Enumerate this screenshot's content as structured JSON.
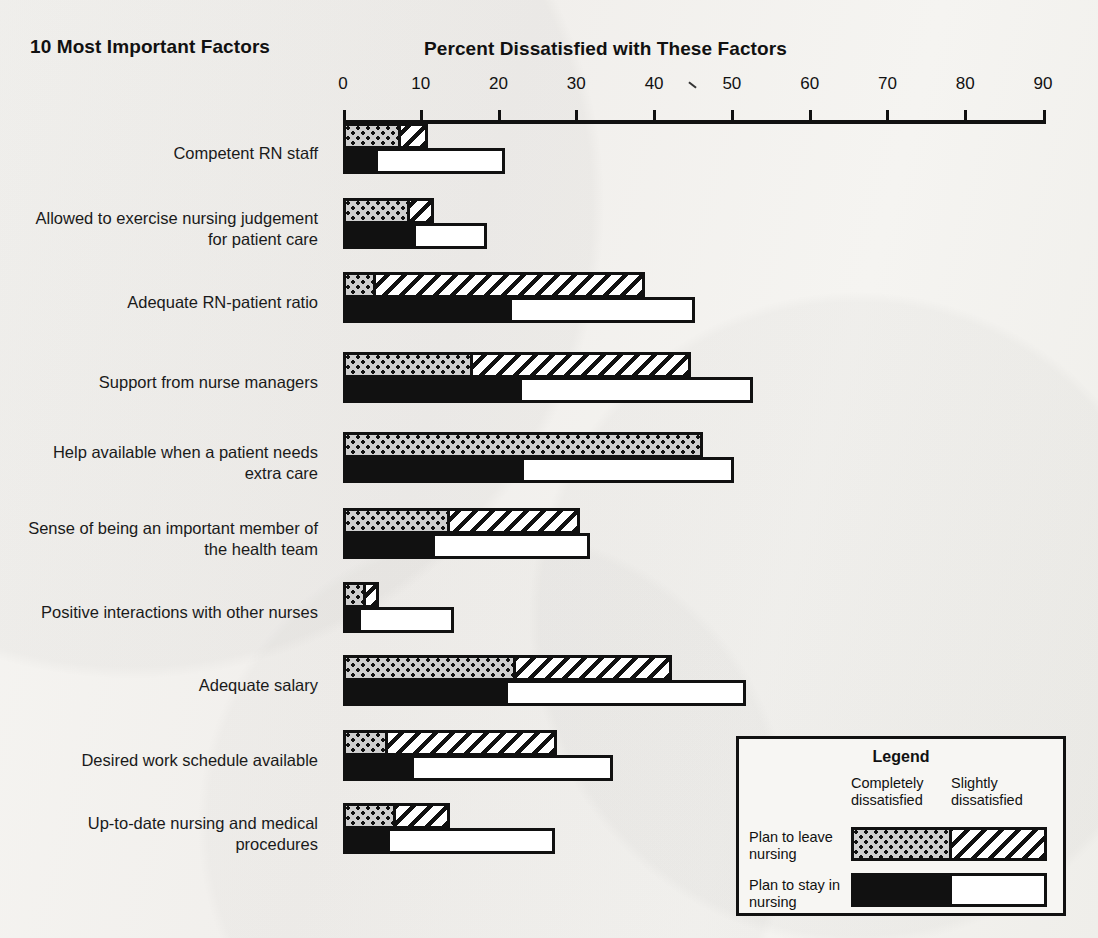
{
  "headings": {
    "left": "10 Most Important Factors",
    "right": "Percent Dissatisfied with These Factors"
  },
  "legend": {
    "title": "Legend",
    "col_completely": "Completely dissatisfied",
    "col_slightly": "Slightly dissatisfied",
    "row_leave": "Plan to leave nursing",
    "row_stay": "Plan to stay in nursing"
  },
  "chart_data": {
    "type": "bar",
    "orientation": "horizontal",
    "title": "Percent Dissatisfied with These Factors",
    "subtitle": "10 Most Important Factors",
    "xlabel": "Percent Dissatisfied with These Factors",
    "ylabel": "10 Most Important Factors",
    "xlim": [
      0,
      90
    ],
    "xticks": [
      0,
      10,
      20,
      30,
      40,
      50,
      60,
      70,
      80,
      90
    ],
    "xticklabels": [
      "0",
      "10",
      "20",
      "30",
      "40",
      "50",
      "60",
      "70",
      "80",
      "90"
    ],
    "grid": false,
    "legend_position": "bottom-right",
    "stacked": true,
    "group_series": [
      {
        "name": "Plan to leave nursing",
        "segments": [
          "Completely dissatisfied",
          "Slightly dissatisfied"
        ],
        "fills": [
          "dotted",
          "hatched"
        ]
      },
      {
        "name": "Plan to stay in nursing",
        "segments": [
          "Completely dissatisfied",
          "Slightly dissatisfied"
        ],
        "fills": [
          "solid-black",
          "white"
        ]
      }
    ],
    "categories": [
      "Competent RN staff",
      "Allowed to exercise nursing judgement for patient care",
      "Adequate RN-patient ratio",
      "Support from nurse managers",
      "Help available when a patient needs extra care",
      "Sense of being an important member of the health team",
      "Positive interactions with other nurses",
      "Adequate salary",
      "Desired work schedule available",
      "Up-to-date nursing and medical procedures"
    ],
    "category_lines": [
      [
        "Competent RN staff"
      ],
      [
        "Allowed to exercise nursing judgement",
        "for patient care"
      ],
      [
        "Adequate RN-patient ratio"
      ],
      [
        "Support from nurse managers"
      ],
      [
        "Help available when a patient needs",
        "extra care"
      ],
      [
        "Sense of being an important member of",
        "the health team"
      ],
      [
        "Positive interactions with other nurses"
      ],
      [
        "Adequate salary"
      ],
      [
        "Desired work schedule available"
      ],
      [
        "Up-to-date nursing and medical",
        "procedures"
      ]
    ],
    "rows": [
      {
        "category": "Competent RN staff",
        "leave": {
          "completely": 6.7,
          "slightly": 3.4,
          "total": 10.1
        },
        "stay": {
          "completely": 3.7,
          "slightly": 16.3,
          "total": 20.0
        }
      },
      {
        "category": "Allowed to exercise nursing judgement for patient care",
        "leave": {
          "completely": 7.8,
          "slightly": 3.1,
          "total": 10.9
        },
        "stay": {
          "completely": 8.6,
          "slightly": 9.2,
          "total": 17.8
        }
      },
      {
        "category": "Adequate RN-patient ratio",
        "leave": {
          "completely": 3.5,
          "slightly": 34.5,
          "total": 38.0
        },
        "stay": {
          "completely": 21.0,
          "slightly": 23.5,
          "total": 44.5
        }
      },
      {
        "category": "Support from nurse managers",
        "leave": {
          "completely": 16.0,
          "slightly": 28.0,
          "total": 44.0
        },
        "stay": {
          "completely": 22.3,
          "slightly": 29.7,
          "total": 52.0
        }
      },
      {
        "category": "Help available when a patient needs extra care",
        "leave": {
          "completely": 45.5,
          "slightly": 0.0,
          "total": 45.5
        },
        "stay": {
          "completely": 22.5,
          "slightly": 27.0,
          "total": 49.5
        }
      },
      {
        "category": "Sense of being an important member of the health team",
        "leave": {
          "completely": 13.0,
          "slightly": 16.7,
          "total": 29.7
        },
        "stay": {
          "completely": 11.0,
          "slightly": 20.0,
          "total": 31.0
        }
      },
      {
        "category": "Positive interactions with other nurses",
        "leave": {
          "completely": 2.2,
          "slightly": 1.6,
          "total": 3.8
        },
        "stay": {
          "completely": 1.5,
          "slightly": 12.0,
          "total": 13.5
        }
      },
      {
        "category": "Adequate salary",
        "leave": {
          "completely": 21.5,
          "slightly": 20.0,
          "total": 41.5
        },
        "stay": {
          "completely": 20.5,
          "slightly": 30.5,
          "total": 51.0
        }
      },
      {
        "category": "Desired work schedule available",
        "leave": {
          "completely": 5.0,
          "slightly": 21.8,
          "total": 26.8
        },
        "stay": {
          "completely": 8.3,
          "slightly": 25.7,
          "total": 34.0
        }
      },
      {
        "category": "Up-to-date nursing and medical procedures",
        "leave": {
          "completely": 6.0,
          "slightly": 7.0,
          "total": 13.0
        },
        "stay": {
          "completely": 5.3,
          "slightly": 21.2,
          "total": 26.5
        }
      }
    ]
  }
}
